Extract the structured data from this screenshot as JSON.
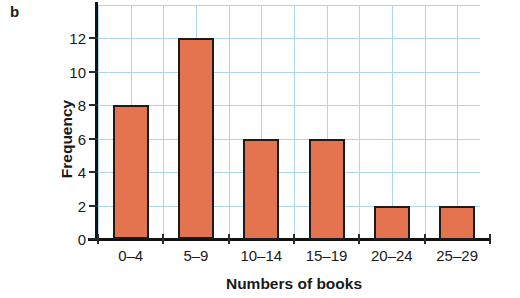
{
  "figure": {
    "part_label": "b"
  },
  "chart_data": {
    "type": "bar",
    "title": "",
    "xlabel": "Numbers of books",
    "ylabel": "Frequency",
    "categories": [
      "0–4",
      "5–9",
      "10–14",
      "15–19",
      "20–24",
      "25–29"
    ],
    "values": [
      8,
      12,
      6,
      6,
      2,
      2
    ],
    "ylim": [
      0,
      13
    ],
    "ytick_labels": [
      "0",
      "2",
      "4",
      "6",
      "8",
      "10",
      "12"
    ],
    "ytick_values": [
      0,
      2,
      4,
      6,
      8,
      10,
      12
    ],
    "grid": true,
    "grid_color": "#aed6ee",
    "bar_color": "#e4734f",
    "bar_edge_color": "#1b1b1b",
    "legend": null,
    "legend_position": "none"
  }
}
